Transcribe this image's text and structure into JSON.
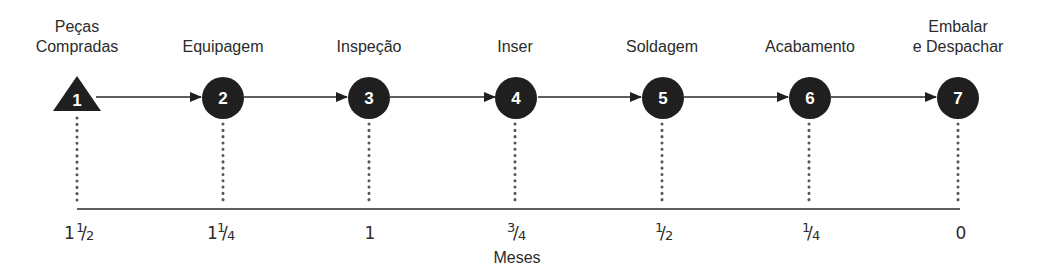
{
  "diagram": {
    "title": "",
    "steps": [
      {
        "number": "1",
        "label_line1": "Peças",
        "label_line2": "Compradas",
        "shape": "triangle",
        "time_whole": "1",
        "time_num": "1",
        "time_den": "2",
        "time_display": "1 1/2"
      },
      {
        "number": "2",
        "label_line1": "",
        "label_line2": "Equipagem",
        "shape": "circle",
        "time_whole": "1",
        "time_num": "1",
        "time_den": "4",
        "time_display": "1 1/4"
      },
      {
        "number": "3",
        "label_line1": "",
        "label_line2": "Inspeção",
        "shape": "circle",
        "time_whole": "1",
        "time_num": "",
        "time_den": "",
        "time_display": "1"
      },
      {
        "number": "4",
        "label_line1": "",
        "label_line2": "Inser",
        "shape": "circle",
        "time_whole": "",
        "time_num": "3",
        "time_den": "4",
        "time_display": "3/4"
      },
      {
        "number": "5",
        "label_line1": "",
        "label_line2": "Soldagem",
        "shape": "circle",
        "time_whole": "",
        "time_num": "1",
        "time_den": "2",
        "time_display": "1/2"
      },
      {
        "number": "6",
        "label_line1": "",
        "label_line2": "Acabamento",
        "shape": "circle",
        "time_whole": "",
        "time_num": "1",
        "time_den": "4",
        "time_display": "1/4"
      },
      {
        "number": "7",
        "label_line1": "Embalar",
        "label_line2": "e Despachar",
        "shape": "circle",
        "time_whole": "0",
        "time_num": "",
        "time_den": "",
        "time_display": "0"
      }
    ],
    "axis": {
      "title": "Meses"
    },
    "colors": {
      "node_fill": "#1f1f1f",
      "node_text": "#ffffff",
      "line": "#2a2a2a",
      "dotted": "#555555",
      "text": "#2b2b2b"
    }
  }
}
